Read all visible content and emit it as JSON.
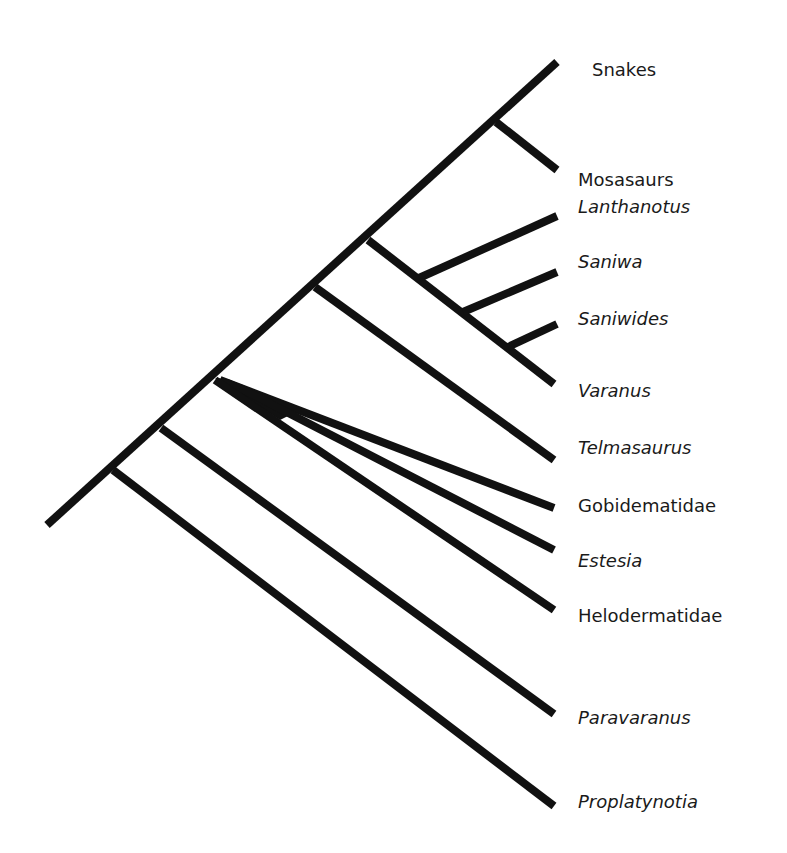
{
  "diagram": {
    "type": "cladogram",
    "line_color": "#111111",
    "taxa": [
      {
        "label": "Snakes",
        "italic": false
      },
      {
        "label": "Mosasaurs",
        "italic": false
      },
      {
        "label": "Lanthanotus",
        "italic": true
      },
      {
        "label": "Saniwa",
        "italic": true
      },
      {
        "label": "Saniwides",
        "italic": true
      },
      {
        "label": "Varanus",
        "italic": true
      },
      {
        "label": "Telmasaurus",
        "italic": true
      },
      {
        "label": "Gobidematidae",
        "italic": false
      },
      {
        "label": "Estesia",
        "italic": true
      },
      {
        "label": "Helodermatidae",
        "italic": false
      },
      {
        "label": "Paravaranus",
        "italic": true
      },
      {
        "label": "Proplatynotia",
        "italic": true
      }
    ]
  }
}
